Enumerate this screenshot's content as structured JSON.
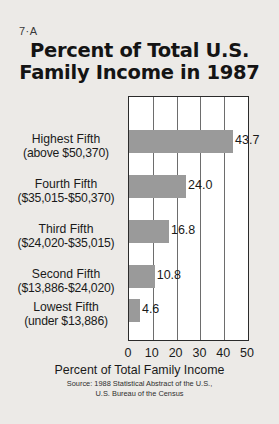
{
  "figure": {
    "number": "7·A",
    "background_color": "#eceae7",
    "plot_background_color": "#ffffff",
    "bar_color": "#9a9a9a",
    "axis_color": "#2b2b2b"
  },
  "title": {
    "line1": "Percent of Total U.S.",
    "line2": "Family Income in 1987"
  },
  "chart_data": {
    "type": "bar",
    "orientation": "horizontal",
    "title": "Percent of Total U.S. Family Income in 1987",
    "xlabel": "Percent of Total Family Income",
    "ylabel": "",
    "xlim": [
      0,
      50
    ],
    "xticks": [
      0,
      10,
      20,
      30,
      40,
      50
    ],
    "xtick_labels": [
      "0",
      "10",
      "20",
      "30",
      "40",
      "50"
    ],
    "grid": "vertical",
    "legend": "none",
    "categories": [
      "Highest Fifth (above $50,370)",
      "Fourth Fifth ($35,015-$50,370)",
      "Third Fifth ($24,020-$35,015)",
      "Second Fifth ($13,886-$24,020)",
      "Lowest Fifth (under $13,886)"
    ],
    "category_lines": [
      {
        "line1": "Highest Fifth",
        "line2": "(above $50,370)"
      },
      {
        "line1": "Fourth Fifth",
        "line2": "($35,015-$50,370)"
      },
      {
        "line1": "Third Fifth",
        "line2": "($24,020-$35,015)"
      },
      {
        "line1": "Second Fifth",
        "line2": "($13,886-$24,020)"
      },
      {
        "line1": "Lowest Fifth",
        "line2": "(under $13,886)"
      }
    ],
    "values": [
      43.7,
      24.0,
      16.8,
      10.8,
      4.6
    ],
    "value_labels": [
      "43.7",
      "24.0",
      "16.8",
      "10.8",
      "4.6"
    ],
    "source": {
      "line1": "Source: 1988 Statistical Abstract of the U.S.,",
      "line2": "U.S. Bureau of the Census"
    }
  }
}
